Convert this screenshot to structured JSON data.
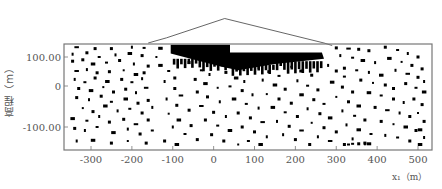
{
  "chart_data": {
    "type": "scatter",
    "title": "",
    "xlabel": "x₁（m）",
    "ylabel": "高程（m）",
    "xlim": [
      -360,
      530
    ],
    "ylim": [
      -180,
      140
    ],
    "x_ticks": [
      -300,
      -200,
      -100,
      0,
      100,
      200,
      300,
      400,
      500
    ],
    "x_tick_labels": [
      "-300",
      "-200",
      "-100",
      "0",
      "100",
      "200",
      "300",
      "400",
      "500"
    ],
    "y_ticks": [
      100,
      0,
      -100
    ],
    "y_tick_labels": [
      "100.00",
      "0",
      "-100.00"
    ],
    "grid": false,
    "legend": null,
    "annotations": [
      {
        "type": "outline",
        "name": "embankment-profile",
        "points": [
          [
            -160,
            140
          ],
          [
            -115,
            155
          ],
          [
            27,
            210
          ],
          [
            270,
            140
          ],
          [
            290,
            133
          ]
        ]
      },
      {
        "type": "filled-region",
        "name": "dense-failure-zone-upper",
        "points": [
          [
            -105,
            135
          ],
          [
            40,
            135
          ],
          [
            40,
            113
          ],
          [
            265,
            113
          ],
          [
            270,
            95
          ],
          [
            150,
            80
          ],
          [
            60,
            62
          ],
          [
            20,
            72
          ],
          [
            -40,
            90
          ],
          [
            -105,
            110
          ]
        ]
      }
    ],
    "series": [
      {
        "name": "failure-points",
        "marker": "square",
        "color": "#000000",
        "points": [
          [
            -335,
            128
          ],
          [
            -290,
            124
          ],
          [
            -250,
            124
          ],
          [
            -200,
            128
          ],
          [
            -170,
            126
          ],
          [
            -130,
            125
          ],
          [
            -345,
            108
          ],
          [
            -310,
            112
          ],
          [
            -280,
            100
          ],
          [
            -240,
            106
          ],
          [
            -205,
            110
          ],
          [
            -175,
            104
          ],
          [
            -140,
            100
          ],
          [
            -345,
            88
          ],
          [
            -320,
            92
          ],
          [
            -295,
            80
          ],
          [
            -262,
            84
          ],
          [
            -230,
            90
          ],
          [
            -195,
            80
          ],
          [
            -160,
            74
          ],
          [
            -335,
            60
          ],
          [
            -310,
            64
          ],
          [
            -285,
            55
          ],
          [
            -255,
            58
          ],
          [
            -220,
            62
          ],
          [
            -190,
            50
          ],
          [
            -170,
            55
          ],
          [
            -340,
            36
          ],
          [
            -315,
            28
          ],
          [
            -290,
            40
          ],
          [
            -260,
            30
          ],
          [
            -225,
            36
          ],
          [
            -200,
            28
          ],
          [
            -175,
            38
          ],
          [
            -330,
            10
          ],
          [
            -300,
            4
          ],
          [
            -270,
            14
          ],
          [
            -245,
            0
          ],
          [
            -215,
            8
          ],
          [
            -190,
            -2
          ],
          [
            -165,
            12
          ],
          [
            -335,
            -16
          ],
          [
            -305,
            -22
          ],
          [
            -275,
            -12
          ],
          [
            -250,
            -28
          ],
          [
            -215,
            -20
          ],
          [
            -185,
            -32
          ],
          [
            -160,
            -24
          ],
          [
            -320,
            -46
          ],
          [
            -295,
            -56
          ],
          [
            -265,
            -40
          ],
          [
            -235,
            -54
          ],
          [
            -205,
            -48
          ],
          [
            -175,
            -60
          ],
          [
            -150,
            -44
          ],
          [
            -345,
            -76
          ],
          [
            -310,
            -82
          ],
          [
            -280,
            -70
          ],
          [
            -255,
            -86
          ],
          [
            -220,
            -78
          ],
          [
            -190,
            -92
          ],
          [
            -160,
            -80
          ],
          [
            -340,
            -104
          ],
          [
            -315,
            -110
          ],
          [
            -285,
            -100
          ],
          [
            -245,
            -116
          ],
          [
            -210,
            -106
          ],
          [
            -180,
            -120
          ],
          [
            -150,
            -110
          ],
          [
            -335,
            -140
          ],
          [
            -295,
            -138
          ],
          [
            -250,
            -146
          ],
          [
            -210,
            -140
          ],
          [
            -165,
            -146
          ],
          [
            -120,
            -140
          ],
          [
            -130,
            76
          ],
          [
            -110,
            60
          ],
          [
            -95,
            40
          ],
          [
            -120,
            30
          ],
          [
            -95,
            10
          ],
          [
            -80,
            -10
          ],
          [
            -115,
            -20
          ],
          [
            -90,
            -38
          ],
          [
            -60,
            -52
          ],
          [
            -110,
            -62
          ],
          [
            -85,
            -80
          ],
          [
            -55,
            -96
          ],
          [
            -100,
            -100
          ],
          [
            -70,
            -120
          ],
          [
            -40,
            -136
          ],
          [
            -90,
            -150
          ],
          [
            -60,
            84
          ],
          [
            -30,
            62
          ],
          [
            -10,
            50
          ],
          [
            -45,
            36
          ],
          [
            -20,
            24
          ],
          [
            10,
            12
          ],
          [
            -40,
            0
          ],
          [
            -15,
            -14
          ],
          [
            15,
            -28
          ],
          [
            -30,
            -40
          ],
          [
            0,
            -58
          ],
          [
            30,
            -70
          ],
          [
            -20,
            -80
          ],
          [
            10,
            -96
          ],
          [
            40,
            -110
          ],
          [
            -5,
            -122
          ],
          [
            25,
            -140
          ],
          [
            60,
            -150
          ],
          [
            30,
            56
          ],
          [
            55,
            40
          ],
          [
            75,
            30
          ],
          [
            40,
            16
          ],
          [
            70,
            4
          ],
          [
            95,
            -8
          ],
          [
            50,
            -20
          ],
          [
            80,
            -34
          ],
          [
            110,
            -46
          ],
          [
            60,
            -60
          ],
          [
            90,
            -74
          ],
          [
            120,
            -86
          ],
          [
            70,
            -100
          ],
          [
            100,
            -114
          ],
          [
            130,
            -128
          ],
          [
            85,
            -140
          ],
          [
            115,
            -150
          ],
          [
            110,
            70
          ],
          [
            135,
            58
          ],
          [
            160,
            46
          ],
          [
            120,
            34
          ],
          [
            150,
            20
          ],
          [
            175,
            8
          ],
          [
            130,
            -6
          ],
          [
            160,
            -20
          ],
          [
            190,
            -32
          ],
          [
            145,
            -44
          ],
          [
            175,
            -58
          ],
          [
            205,
            -70
          ],
          [
            155,
            -84
          ],
          [
            185,
            -98
          ],
          [
            215,
            -110
          ],
          [
            170,
            -122
          ],
          [
            200,
            -136
          ],
          [
            235,
            -150
          ],
          [
            190,
            72
          ],
          [
            215,
            60
          ],
          [
            240,
            48
          ],
          [
            205,
            32
          ],
          [
            230,
            18
          ],
          [
            255,
            6
          ],
          [
            215,
            -8
          ],
          [
            245,
            -22
          ],
          [
            270,
            -34
          ],
          [
            230,
            -48
          ],
          [
            260,
            -62
          ],
          [
            285,
            -74
          ],
          [
            240,
            -88
          ],
          [
            270,
            -102
          ],
          [
            300,
            -114
          ],
          [
            255,
            -128
          ],
          [
            285,
            -140
          ],
          [
            320,
            -150
          ],
          [
            280,
            76
          ],
          [
            300,
            60
          ],
          [
            320,
            44
          ],
          [
            290,
            28
          ],
          [
            315,
            14
          ],
          [
            340,
            0
          ],
          [
            300,
            -14
          ],
          [
            330,
            -28
          ],
          [
            355,
            -40
          ],
          [
            315,
            -54
          ],
          [
            345,
            -68
          ],
          [
            370,
            -80
          ],
          [
            325,
            -94
          ],
          [
            355,
            -108
          ],
          [
            385,
            -120
          ],
          [
            340,
            -134
          ],
          [
            370,
            -146
          ],
          [
            300,
            126
          ],
          [
            330,
            124
          ],
          [
            355,
            122
          ],
          [
            380,
            118
          ],
          [
            310,
            104
          ],
          [
            340,
            98
          ],
          [
            365,
            90
          ],
          [
            395,
            84
          ],
          [
            320,
            68
          ],
          [
            350,
            62
          ],
          [
            380,
            56
          ],
          [
            410,
            48
          ],
          [
            360,
            34
          ],
          [
            390,
            26
          ],
          [
            420,
            20
          ],
          [
            440,
            10
          ],
          [
            380,
            -2
          ],
          [
            410,
            -10
          ],
          [
            440,
            -20
          ],
          [
            465,
            -30
          ],
          [
            395,
            -44
          ],
          [
            425,
            -52
          ],
          [
            455,
            -60
          ],
          [
            480,
            -70
          ],
          [
            410,
            -84
          ],
          [
            440,
            -92
          ],
          [
            470,
            -100
          ],
          [
            495,
            -110
          ],
          [
            420,
            -124
          ],
          [
            450,
            -130
          ],
          [
            480,
            -140
          ],
          [
            505,
            -150
          ],
          [
            420,
            128
          ],
          [
            450,
            120
          ],
          [
            475,
            110
          ],
          [
            500,
            100
          ],
          [
            430,
            96
          ],
          [
            460,
            86
          ],
          [
            485,
            76
          ],
          [
            510,
            66
          ],
          [
            445,
            62
          ],
          [
            475,
            52
          ],
          [
            500,
            42
          ],
          [
            515,
            30
          ],
          [
            470,
            24
          ],
          [
            495,
            12
          ],
          [
            515,
            0
          ],
          [
            490,
            -20
          ],
          [
            510,
            -36
          ],
          [
            500,
            -60
          ],
          [
            515,
            -84
          ],
          [
            505,
            -108
          ],
          [
            515,
            -130
          ],
          [
            340,
            -148
          ],
          [
            355,
            -148
          ],
          [
            370,
            -148
          ],
          [
            380,
            -148
          ],
          [
            330,
            -150
          ]
        ]
      }
    ]
  }
}
